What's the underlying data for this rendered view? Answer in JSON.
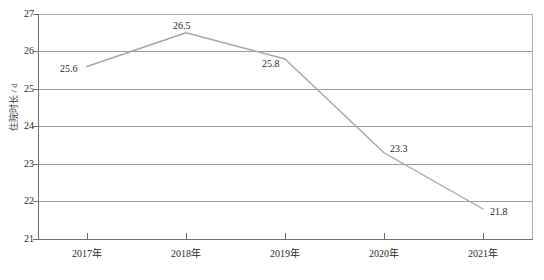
{
  "chart_data": {
    "type": "line",
    "title": "",
    "xlabel": "",
    "ylabel": "住院时长 / d",
    "categories": [
      "2017年",
      "2018年",
      "2019年",
      "2020年",
      "2021年"
    ],
    "values": [
      25.6,
      26.5,
      25.8,
      23.3,
      21.8
    ],
    "point_labels": [
      "25.6",
      "26.5",
      "25.8",
      "23.3",
      "21.8"
    ],
    "ylim": [
      21,
      27
    ],
    "yticks": [
      27,
      26,
      25,
      24,
      23,
      22,
      21
    ],
    "ytick_labels": [
      "27",
      "26",
      "25",
      "24",
      "23",
      "22",
      "21"
    ],
    "grid": true,
    "grid_axis": "y",
    "legend": false,
    "series": [
      {
        "name": "住院时长",
        "values": [
          25.6,
          26.5,
          25.8,
          23.3,
          21.8
        ],
        "color": "#a6a6a6"
      }
    ],
    "colors": {
      "line": "#a6a6a6",
      "grid": "#9e9e9e",
      "axis": "#6e6e6e",
      "frame": "#b0b0b0",
      "text": "#2b2b2b"
    }
  }
}
